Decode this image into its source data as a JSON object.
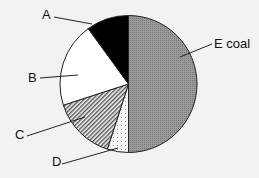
{
  "chart_data": {
    "type": "pie",
    "title": "",
    "start": "top",
    "direction": "counterclockwise-from-E",
    "slices": [
      {
        "label": "E",
        "sublabel": "coal",
        "value": 50,
        "fill": "pattern-grid"
      },
      {
        "label": "D",
        "sublabel": "",
        "value": 5,
        "fill": "pattern-dots"
      },
      {
        "label": "C",
        "sublabel": "",
        "value": 15,
        "fill": "pattern-hatch"
      },
      {
        "label": "B",
        "sublabel": "",
        "value": 20,
        "fill": "white"
      },
      {
        "label": "A",
        "sublabel": "",
        "value": 10,
        "fill": "black"
      }
    ],
    "legend": "none",
    "colors": {
      "background": "#f2f2f2",
      "grid": "#8a8a8a",
      "black": "#000000",
      "white": "#ffffff",
      "outline": "#222222"
    }
  }
}
